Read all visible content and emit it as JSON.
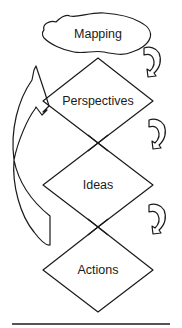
{
  "diagram": {
    "nodes": [
      {
        "id": "mapping",
        "label": "Mapping",
        "shape": "cloud"
      },
      {
        "id": "perspectives",
        "label": "Perspectives",
        "shape": "diamond"
      },
      {
        "id": "ideas",
        "label": "Ideas",
        "shape": "diamond"
      },
      {
        "id": "actions",
        "label": "Actions",
        "shape": "diamond"
      }
    ],
    "edges": [
      {
        "from": "mapping",
        "to": "perspectives",
        "style": "curved-arrow-right"
      },
      {
        "from": "perspectives",
        "to": "ideas",
        "style": "curved-arrow-right"
      },
      {
        "from": "ideas",
        "to": "actions",
        "style": "curved-arrow-right"
      },
      {
        "from": "ideas",
        "to": "mapping",
        "style": "large-feedback-arrow-left"
      }
    ],
    "colors": {
      "stroke": "#1a1a1a",
      "background": "#ffffff",
      "rule": "#555555"
    }
  }
}
